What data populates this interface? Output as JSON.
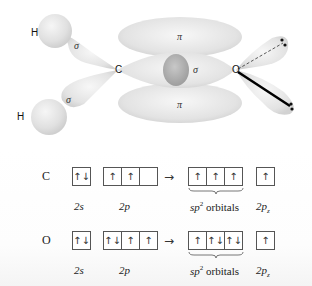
{
  "diagram": {
    "atoms": {
      "H1": "H",
      "H2": "H",
      "C": "C",
      "O": "O"
    },
    "bond_labels": {
      "ch_upper": "σ",
      "ch_lower": "σ",
      "co_sigma": "σ",
      "pi_upper": "π",
      "pi_lower": "π"
    }
  },
  "configurations": [
    {
      "element": "C",
      "s2": [
        "↑↓"
      ],
      "p2": [
        "↑",
        "↑",
        ""
      ],
      "arrow": "→",
      "sp2": [
        "↑",
        "↑",
        "↑"
      ],
      "p2z": [
        "↑"
      ],
      "labels": {
        "s2": "2s",
        "p2": "2p",
        "sp2_main": "sp",
        "sp2_sup": "2",
        "sp2_rest": " orbitals",
        "p2z_main": "2p",
        "p2z_sub": "z"
      }
    },
    {
      "element": "O",
      "s2": [
        "↑↓"
      ],
      "p2": [
        "↑↓",
        "↑",
        "↑"
      ],
      "arrow": "→",
      "sp2": [
        "↑",
        "↑↓",
        "↑↓"
      ],
      "p2z": [
        "↑"
      ],
      "labels": {
        "s2": "2s",
        "p2": "2p",
        "sp2_main": "sp",
        "sp2_sup": "2",
        "sp2_rest": " orbitals",
        "p2z_main": "2p",
        "p2z_sub": "z"
      }
    }
  ]
}
